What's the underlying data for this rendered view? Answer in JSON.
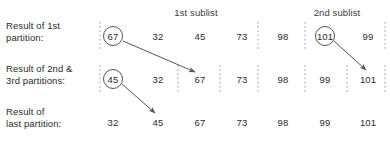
{
  "figure": {
    "type": "quicksort-partition-diagram",
    "width": 390,
    "height": 151,
    "background": "#ffffff",
    "text_color": "#2b2b2b",
    "line_color": "#555555",
    "dash_color": "#9a9a9a"
  },
  "headers": [
    {
      "label": "1st sublist",
      "x": 196,
      "y": 12
    },
    {
      "label": "2nd sublist",
      "x": 337,
      "y": 12
    }
  ],
  "rows": [
    {
      "id": "row-1",
      "label_line1": "Result of 1st",
      "label_line2": "partition:",
      "label_x": 6,
      "label_y": 31,
      "baseline_y": 36,
      "cells": [
        {
          "value": "67",
          "x": 113,
          "circled": true
        },
        {
          "value": "32",
          "x": 158,
          "circled": false
        },
        {
          "value": "45",
          "x": 200,
          "circled": false
        },
        {
          "value": "73",
          "x": 242,
          "circled": false
        },
        {
          "value": "98",
          "x": 283,
          "circled": false
        },
        {
          "value": "101",
          "x": 325,
          "circled": true
        },
        {
          "value": "99",
          "x": 368,
          "circled": false
        }
      ],
      "dividers": [
        100,
        258,
        305,
        385
      ]
    },
    {
      "id": "row-2",
      "label_line1": "Result of 2nd &",
      "label_line2": "3rd partitions:",
      "label_x": 6,
      "label_y": 74,
      "baseline_y": 79,
      "cells": [
        {
          "value": "45",
          "x": 113,
          "circled": true
        },
        {
          "value": "32",
          "x": 158,
          "circled": false
        },
        {
          "value": "67",
          "x": 200,
          "circled": false
        },
        {
          "value": "73",
          "x": 242,
          "circled": false
        },
        {
          "value": "98",
          "x": 283,
          "circled": false
        },
        {
          "value": "99",
          "x": 325,
          "circled": false
        },
        {
          "value": "101",
          "x": 368,
          "circled": false
        }
      ],
      "dividers": [
        100,
        178,
        220,
        258,
        305,
        347,
        385
      ]
    },
    {
      "id": "row-3",
      "label_line1": "Result of",
      "label_line2": "last partition:",
      "label_x": 6,
      "label_y": 117,
      "baseline_y": 122,
      "cells": [
        {
          "value": "32",
          "x": 113,
          "circled": false
        },
        {
          "value": "45",
          "x": 158,
          "circled": false
        },
        {
          "value": "67",
          "x": 200,
          "circled": false
        },
        {
          "value": "73",
          "x": 242,
          "circled": false
        },
        {
          "value": "98",
          "x": 283,
          "circled": false
        },
        {
          "value": "99",
          "x": 325,
          "circled": false
        },
        {
          "value": "101",
          "x": 368,
          "circled": false
        }
      ],
      "dividers": []
    }
  ],
  "arrows": [
    {
      "id": "arrow-67",
      "from_x": 123,
      "from_y": 41,
      "to_x": 195,
      "to_y": 72
    },
    {
      "id": "arrow-101",
      "from_x": 334,
      "from_y": 41,
      "to_x": 366,
      "to_y": 70
    },
    {
      "id": "arrow-45",
      "from_x": 122,
      "from_y": 84,
      "to_x": 155,
      "to_y": 113
    }
  ],
  "circle_radius": 9.5
}
